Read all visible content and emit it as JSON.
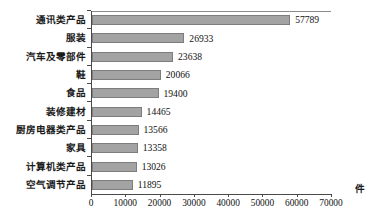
{
  "chart_data": {
    "type": "bar",
    "orientation": "horizontal",
    "title": "",
    "subtitle": "",
    "xlabel": "件",
    "ylabel": "",
    "xlim": [
      0,
      70000
    ],
    "grid": false,
    "legend": null,
    "categories": [
      "通讯类产品",
      "服装",
      "汽车及零部件",
      "鞋",
      "食品",
      "装修建材",
      "厨房电器类产品",
      "家具",
      "计算机类产品",
      "空气调节产品"
    ],
    "values": [
      57789,
      26933,
      23638,
      20066,
      19400,
      14465,
      13566,
      13358,
      13026,
      11895
    ],
    "value_labels": [
      "57789",
      "26933",
      "23638",
      "20066",
      "19400",
      "14465",
      "13566",
      "13358",
      "13026",
      "11895"
    ],
    "xticks": [
      0,
      10000,
      20000,
      30000,
      40000,
      50000,
      60000,
      70000
    ],
    "xtick_labels": [
      "0",
      "10000",
      "20000",
      "30000",
      "40000",
      "50000",
      "60000",
      "70000"
    ],
    "bar_color": "#a3a3a3",
    "bar_border_color": "#7d7d7d",
    "axis_color": "#4a4a4a",
    "text_color": "#111111"
  },
  "axis": {
    "unit": "件"
  }
}
